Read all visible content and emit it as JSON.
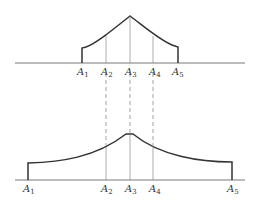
{
  "figure": {
    "top_diagram": {
      "labels": [
        {
          "text": "A",
          "sub": "1",
          "x": 77,
          "y": 67
        },
        {
          "text": "A",
          "sub": "2",
          "x": 101,
          "y": 67
        },
        {
          "text": "A",
          "sub": "3",
          "x": 125,
          "y": 67
        },
        {
          "text": "A",
          "sub": "4",
          "x": 149,
          "y": 67
        },
        {
          "text": "A",
          "sub": "5",
          "x": 172,
          "y": 67
        }
      ]
    },
    "bottom_diagram": {
      "labels": [
        {
          "text": "A",
          "sub": "1",
          "x": 23,
          "y": 184
        },
        {
          "text": "A",
          "sub": "2",
          "x": 101,
          "y": 184
        },
        {
          "text": "A",
          "sub": "3",
          "x": 125,
          "y": 184
        },
        {
          "text": "A",
          "sub": "4",
          "x": 149,
          "y": 184
        },
        {
          "text": "A",
          "sub": "5",
          "x": 227,
          "y": 184
        }
      ]
    },
    "colors": {
      "line": "#333333",
      "thin": "#666666"
    }
  }
}
